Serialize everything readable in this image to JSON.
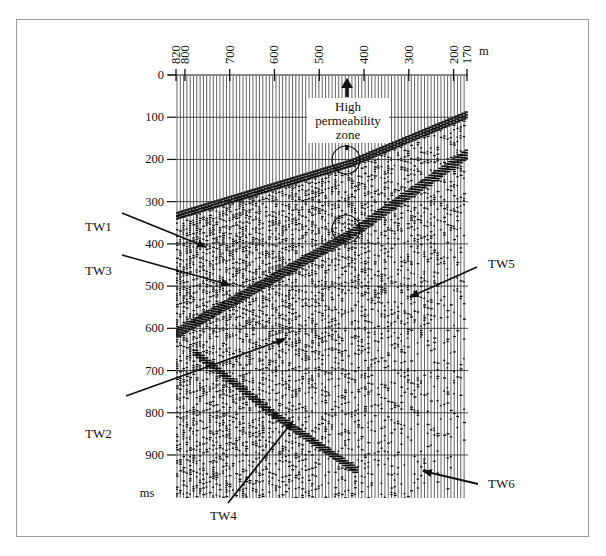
{
  "figure": {
    "x_axis": {
      "unit": "m",
      "ticks": [
        820,
        800,
        700,
        600,
        500,
        400,
        300,
        200,
        170
      ]
    },
    "y_axis": {
      "unit": "ms",
      "ticks": [
        0,
        100,
        200,
        300,
        400,
        500,
        600,
        700,
        800,
        900
      ]
    },
    "callout": {
      "lines": [
        "High",
        "permeability",
        "zone"
      ]
    },
    "annotations": [
      {
        "id": "tw1",
        "label": "TW1"
      },
      {
        "id": "tw2",
        "label": "TW2"
      },
      {
        "id": "tw3",
        "label": "TW3"
      },
      {
        "id": "tw4",
        "label": "TW4"
      },
      {
        "id": "tw5",
        "label": "TW5"
      },
      {
        "id": "tw6",
        "label": "TW6"
      }
    ],
    "colors": {
      "ink": "#111111",
      "frame": "#9a9a9a",
      "background": "#ffffff"
    }
  },
  "chart_data": {
    "type": "seismogram",
    "title": "",
    "xlabel": "m",
    "ylabel": "ms",
    "x_ticks": [
      820,
      800,
      700,
      600,
      500,
      400,
      300,
      200,
      170
    ],
    "y_ticks": [
      0,
      100,
      200,
      300,
      400,
      500,
      600,
      700,
      800,
      900
    ],
    "xlim": [
      820,
      170
    ],
    "ylim": [
      0,
      950
    ],
    "grid": "horizontal lines every 100 ms",
    "events": [
      {
        "name": "direct wave",
        "points": [
          [
            820,
            325
          ],
          [
            430,
            200
          ],
          [
            170,
            85
          ]
        ]
      },
      {
        "name": "TW3 band",
        "points": [
          [
            820,
            600
          ],
          [
            430,
            365
          ],
          [
            170,
            175
          ]
        ]
      },
      {
        "name": "TW4 band",
        "points": [
          [
            780,
            650
          ],
          [
            600,
            800
          ],
          [
            420,
            930
          ]
        ]
      }
    ],
    "annotations": [
      {
        "label": "TW1",
        "target": [
          760,
          400
        ]
      },
      {
        "label": "TW3",
        "target": [
          700,
          480
        ]
      },
      {
        "label": "TW2",
        "target": [
          640,
          630
        ]
      },
      {
        "label": "TW4",
        "target": [
          620,
          820
        ]
      },
      {
        "label": "TW5",
        "target": [
          310,
          510
        ]
      },
      {
        "label": "TW6",
        "target": [
          280,
          910
        ]
      },
      {
        "label": "High permeability zone",
        "circles": [
          [
            430,
            200
          ],
          [
            430,
            365
          ]
        ]
      }
    ]
  }
}
